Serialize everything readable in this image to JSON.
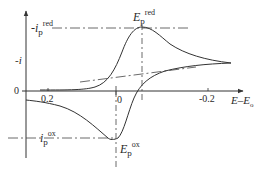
{
  "figure": {
    "type": "cyclic voltammogram",
    "y_axis": {
      "label": "-i",
      "zero_label": "0"
    },
    "x_axis": {
      "label_main": "E–E",
      "label_sub": "o",
      "ticks": [
        "0.2",
        "0",
        "-0.2"
      ]
    },
    "annotations": {
      "ip_red": {
        "prefix": "-i",
        "sub": "p",
        "sup": "red"
      },
      "ip_ox": {
        "prefix": "i",
        "sub": "p",
        "sup": "ox"
      },
      "Ep_red": {
        "prefix": "E",
        "sub": "p",
        "sup": "red"
      },
      "Ep_ox": {
        "prefix": "E",
        "sub": "p",
        "sup": "ox"
      }
    },
    "colors": {
      "line": "#333333",
      "background": "#ffffff"
    }
  }
}
